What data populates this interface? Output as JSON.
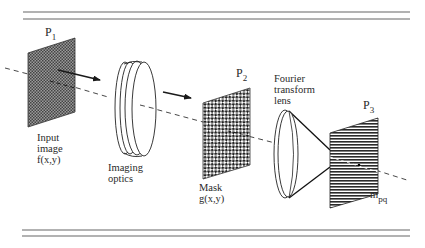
{
  "diagram": {
    "type": "optical-system-schematic",
    "planes": [
      {
        "id": "P1",
        "label_main": "P",
        "label_sub": "1",
        "pattern": "fine-checker"
      },
      {
        "id": "P2",
        "label_main": "P",
        "label_sub": "2",
        "pattern": "coarse-checker"
      },
      {
        "id": "P3",
        "label_main": "P",
        "label_sub": "3",
        "pattern": "horizontal-stripes"
      }
    ],
    "labels": {
      "input": [
        "Input",
        "image",
        "f(x,y)"
      ],
      "imaging_optics": [
        "Imaging",
        "optics"
      ],
      "mask": [
        "Mask",
        "g(x,y)"
      ],
      "fourier_lens": [
        "Fourier",
        "transform",
        "lens"
      ],
      "output_main": "m",
      "output_sub": "pq"
    },
    "colors": {
      "line": "#2a2a2a",
      "rule": "#6a6a6a",
      "plate_fill_p1": "#8a8a8a",
      "plate_fill_p2": "#a0a0a0",
      "plate_stripe": "#333333",
      "background": "#ffffff"
    }
  }
}
